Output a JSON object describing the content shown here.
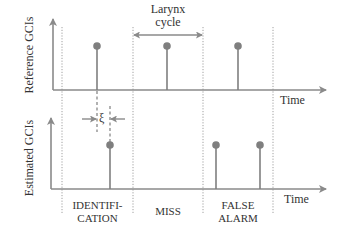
{
  "diagram": {
    "top_axis": {
      "label": "Reference GCIs",
      "time_label": "Time"
    },
    "bottom_axis": {
      "label": "Estimated GCIs",
      "time_label": "Time"
    },
    "larynx_cycle": {
      "line1": "Larynx",
      "line2": "cycle"
    },
    "xi_symbol": "ξ",
    "regions": [
      {
        "line1": "IDENTIFI-",
        "line2": "CATION"
      },
      {
        "line1": "MISS",
        "line2": ""
      },
      {
        "line1": "FALSE",
        "line2": "ALARM"
      }
    ],
    "colors": {
      "axis": "#8a8a8a",
      "stem": "#7f7f7f",
      "text": "#333333",
      "dotted": "#9a9a9a"
    }
  }
}
